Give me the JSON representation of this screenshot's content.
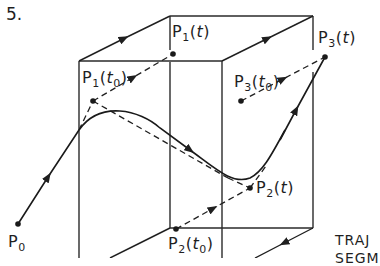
{
  "figure": {
    "number": "5.",
    "caption_lines": [
      "TRAJ",
      "SEGM"
    ]
  },
  "points": {
    "p0": {
      "base": "P",
      "sub": "0",
      "arg": ""
    },
    "p1_t": {
      "base": "P",
      "sub": "1",
      "arg": "t"
    },
    "p1_t0": {
      "base": "P",
      "sub": "1",
      "arg": "t",
      "arg_sub": "0"
    },
    "p2_t": {
      "base": "P",
      "sub": "2",
      "arg": "t"
    },
    "p2_t0": {
      "base": "P",
      "sub": "2",
      "arg": "t",
      "arg_sub": "0"
    },
    "p3_t": {
      "base": "P",
      "sub": "3",
      "arg": "t"
    },
    "p3_t0": {
      "base": "P",
      "sub": "3",
      "arg": "t",
      "arg_sub": "0"
    }
  },
  "colors": {
    "ink": "#1f1f1f",
    "background": "#ffffff"
  }
}
